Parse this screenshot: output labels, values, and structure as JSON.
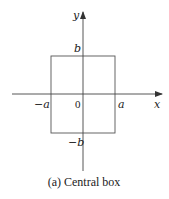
{
  "diagram": {
    "caption": "(a) Central box",
    "axes": {
      "x_label": "x",
      "y_label": "y",
      "origin_label": "0"
    },
    "box": {
      "left_label": "−a",
      "right_label": "a",
      "top_label": "b",
      "bottom_label": "−b"
    },
    "colors": {
      "line": "#444444",
      "text": "#222222",
      "background": "#ffffff"
    }
  }
}
